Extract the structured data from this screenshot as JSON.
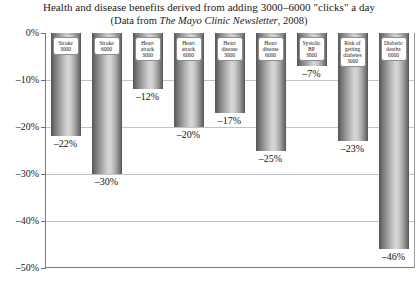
{
  "chart_data": {
    "type": "bar",
    "title": "Health and disease benefits derived from adding 3000–6000 \"clicks\" a day",
    "subtitle_prefix": "(Data from ",
    "subtitle_italic": "The Mayo Clinic Newsletter",
    "subtitle_suffix": ", 2008)",
    "xlabel": "",
    "ylabel": "",
    "ylim": [
      -50,
      0
    ],
    "grid": true,
    "legend": "none",
    "ytick_labels": [
      "0%",
      "–10%",
      "–20%",
      "–30%",
      "–40%",
      "–50%"
    ],
    "ytick_values": [
      0,
      -10,
      -20,
      -30,
      -40,
      -50
    ],
    "gridline_values": [
      -10,
      -20,
      -30,
      -40
    ],
    "categories": [
      "Stroke 3000",
      "Stroke 6000",
      "Heart attack 3000",
      "Heart attack 6000",
      "Heart disease 3000",
      "Heart disease 6000",
      "Systolic BP 3000",
      "Risk of getting diabetes 3000",
      "Diabetic deaths 6000"
    ],
    "values": [
      -22,
      -30,
      -12,
      -20,
      -17,
      -25,
      -7,
      -23,
      -46
    ],
    "data_labels": [
      "–22%",
      "–30%",
      "–12%",
      "–20%",
      "–17%",
      "–25%",
      "–7%",
      "–23%",
      "–46%"
    ],
    "bars": [
      {
        "name": "Stroke",
        "dose": "3000",
        "value": -22,
        "label": "–22%"
      },
      {
        "name": "Stroke",
        "dose": "6000",
        "value": -30,
        "label": "–30%"
      },
      {
        "name": "Heart attack",
        "dose": "3000",
        "value": -12,
        "label": "–12%"
      },
      {
        "name": "Heart attack",
        "dose": "6000",
        "value": -20,
        "label": "–20%"
      },
      {
        "name": "Heart disease",
        "dose": "3000",
        "value": -17,
        "label": "–17%"
      },
      {
        "name": "Heart disease",
        "dose": "6000",
        "value": -25,
        "label": "–25%"
      },
      {
        "name": "Systolic BP",
        "dose": "3000",
        "value": -7,
        "label": "–7%"
      },
      {
        "name": "Risk of getting diabetes",
        "dose": "3000",
        "value": -23,
        "label": "–23%"
      },
      {
        "name": "Diabetic deaths",
        "dose": "6000",
        "value": -46,
        "label": "–46%"
      }
    ],
    "colors": {
      "bar_dark": "#5d5d5d",
      "bar_light": "#d6d6d6",
      "gridline": "#b9c4cc",
      "axis": "#7b7b7b",
      "text": "#1a1a1a",
      "label_box_bg": "#ffffff",
      "label_box_border": "#8d8d8d"
    }
  }
}
